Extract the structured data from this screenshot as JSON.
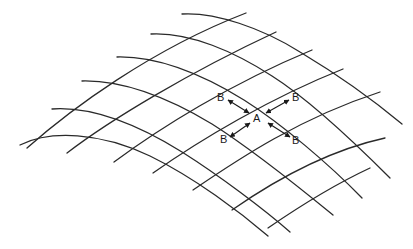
{
  "figure": {
    "center_label": "A",
    "neighbor_labels": [
      "B",
      "B",
      "B",
      "B"
    ],
    "colors": {
      "line": "#2a2a2a",
      "text": "#1a1a1a",
      "background": "#ffffff"
    }
  },
  "grid": {
    "family_descending": [
      "M182,14 C215,12 262,28 300,52 C340,76 378,104 402,124",
      "M151,34 C190,32 235,52 272,76 C310,100 352,140 390,178",
      "M117,57 C160,56 205,76 244,100 C282,124 330,165 362,198",
      "M82,81 C125,80 172,100 212,124 C250,148 300,188 333,215",
      "M52,109 C95,106 140,126 182,152 C220,176 265,210 290,232",
      "M20,145 C50,130 100,132 150,156 C195,178 240,212 268,236"
    ],
    "family_ascending": [
      "M27,148 C70,110 150,50 246,13",
      "M67,153 C110,120 190,72 276,32",
      "M114,162 C160,128 230,84 312,50",
      "M153,173 C200,140 270,98 343,69",
      "M193,190 C240,158 300,118 380,92",
      "M232,210 C278,178 330,150 385,138",
      "M268,228 C300,206 340,182 370,168"
    ]
  },
  "labels": [
    {
      "id": "b-upper-left",
      "text": "B",
      "x": 217,
      "y": 101
    },
    {
      "id": "b-upper-right",
      "text": "B",
      "x": 292,
      "y": 101
    },
    {
      "id": "a-center",
      "text": "A",
      "x": 253,
      "y": 122
    },
    {
      "id": "b-lower-left",
      "text": "B",
      "x": 220,
      "y": 143
    },
    {
      "id": "b-lower-right",
      "text": "B",
      "x": 292,
      "y": 144
    }
  ],
  "arrows": [
    {
      "id": "arrow-a-to-b-upper-left",
      "x1": 228,
      "y1": 100,
      "x2": 249,
      "y2": 113
    },
    {
      "id": "arrow-a-to-b-upper-right",
      "x1": 289,
      "y1": 100,
      "x2": 266,
      "y2": 113
    },
    {
      "id": "arrow-a-to-b-lower-left",
      "x1": 230,
      "y1": 137,
      "x2": 250,
      "y2": 123
    },
    {
      "id": "arrow-a-to-b-lower-right",
      "x1": 290,
      "y1": 137,
      "x2": 268,
      "y2": 123
    }
  ]
}
